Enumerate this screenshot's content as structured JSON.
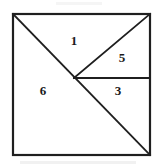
{
  "figure": {
    "type": "geometric-diagram",
    "canvas": {
      "width": 156,
      "height": 168
    },
    "background_color": "#ffffff",
    "line_color": "#1f1f1f",
    "label_color": "#1a1a1a",
    "square": {
      "name": "outer-square",
      "top_left": [
        13,
        14
      ],
      "top_right": [
        150,
        14
      ],
      "bottom_right": [
        150,
        155
      ],
      "bottom_left": [
        13,
        155
      ],
      "stroke_width": 2.2
    },
    "junction_point": [
      74,
      78
    ],
    "internal_lines": [
      {
        "name": "main-diagonal",
        "from": [
          13,
          14
        ],
        "to": [
          150,
          155
        ],
        "stroke_width": 1.8
      },
      {
        "name": "junction-to-top-right",
        "from": [
          74,
          78
        ],
        "to": [
          150,
          14
        ],
        "stroke_width": 1.8
      },
      {
        "name": "junction-horizontal",
        "from": [
          74,
          78
        ],
        "to": [
          150,
          78
        ],
        "stroke_width": 1.8
      }
    ],
    "regions": [
      {
        "name": "region-1",
        "label": "1",
        "x": 74,
        "y": 42
      },
      {
        "name": "region-5",
        "label": "5",
        "x": 122,
        "y": 59
      },
      {
        "name": "region-3",
        "label": "3",
        "x": 118,
        "y": 92
      },
      {
        "name": "region-6",
        "label": "6",
        "x": 43,
        "y": 92
      }
    ]
  }
}
